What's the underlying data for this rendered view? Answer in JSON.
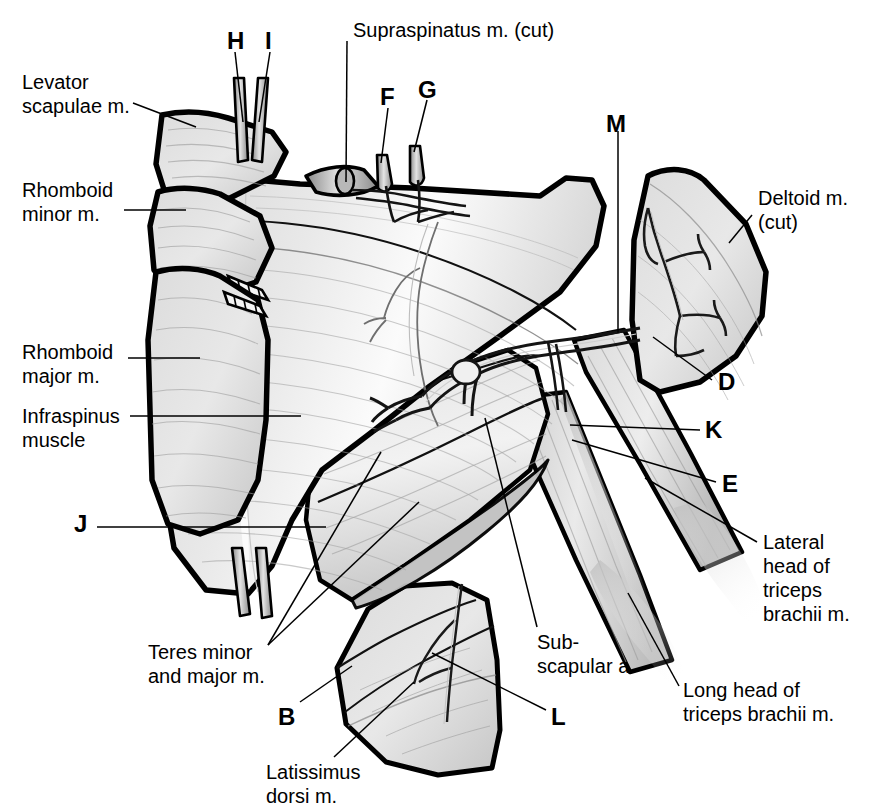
{
  "figure": {
    "style": {
      "ink": "#000000",
      "muscle_light": "#e6e6e6",
      "muscle_mid": "#d0d0d0",
      "muscle_dark": "#b0b0b0",
      "highlight": "#f7f7f7",
      "vessel": "#8f8f8f",
      "background": "#ffffff"
    }
  },
  "labels": [
    {
      "id": "levator-scapulae",
      "text": "Levator\nscapulae m.",
      "x": 22,
      "y": 70,
      "bold": false,
      "align": "left"
    },
    {
      "id": "rhomboid-minor",
      "text": "Rhomboid\nminor m.",
      "x": 22,
      "y": 178,
      "bold": false,
      "align": "left"
    },
    {
      "id": "rhomboid-major",
      "text": "Rhomboid\nmajor m.",
      "x": 22,
      "y": 340,
      "bold": false,
      "align": "left"
    },
    {
      "id": "infraspinus",
      "text": "Infraspinus\nmuscle",
      "x": 22,
      "y": 404,
      "bold": false,
      "align": "left"
    },
    {
      "id": "supraspinatus",
      "text": "Supraspinatus m. (cut)",
      "x": 353,
      "y": 18,
      "bold": false,
      "align": "left"
    },
    {
      "id": "deltoid",
      "text": "Deltoid m.\n(cut)",
      "x": 758,
      "y": 186,
      "bold": false,
      "align": "left"
    },
    {
      "id": "lateral-head",
      "text": "Lateral\nhead of\ntriceps\nbrachii m.",
      "x": 763,
      "y": 530,
      "bold": false,
      "align": "left"
    },
    {
      "id": "long-head",
      "text": "Long head of\ntriceps brachii m.",
      "x": 683,
      "y": 678,
      "bold": false,
      "align": "left"
    },
    {
      "id": "subscapular-a",
      "text": "Sub-\nscapular a.",
      "x": 537,
      "y": 630,
      "bold": false,
      "align": "left"
    },
    {
      "id": "teres-minor-major",
      "text": "Teres minor\nand major m.",
      "x": 148,
      "y": 640,
      "bold": false,
      "align": "left"
    },
    {
      "id": "latissimus-dorsi",
      "text": "Latissimus\ndorsi m.",
      "x": 266,
      "y": 760,
      "bold": false,
      "align": "left"
    },
    {
      "id": "marker-h",
      "text": "H",
      "x": 227,
      "y": 29,
      "bold": true,
      "align": "left"
    },
    {
      "id": "marker-i",
      "text": "I",
      "x": 265,
      "y": 29,
      "bold": true,
      "align": "left"
    },
    {
      "id": "marker-f",
      "text": "F",
      "x": 380,
      "y": 85,
      "bold": true,
      "align": "left"
    },
    {
      "id": "marker-g",
      "text": "G",
      "x": 418,
      "y": 78,
      "bold": true,
      "align": "left"
    },
    {
      "id": "marker-m",
      "text": "M",
      "x": 606,
      "y": 112,
      "bold": true,
      "align": "left"
    },
    {
      "id": "marker-d",
      "text": "D",
      "x": 718,
      "y": 370,
      "bold": true,
      "align": "left"
    },
    {
      "id": "marker-k",
      "text": "K",
      "x": 705,
      "y": 418,
      "bold": true,
      "align": "left"
    },
    {
      "id": "marker-e",
      "text": "E",
      "x": 722,
      "y": 472,
      "bold": true,
      "align": "left"
    },
    {
      "id": "marker-j",
      "text": "J",
      "x": 74,
      "y": 512,
      "bold": true,
      "align": "left"
    },
    {
      "id": "marker-b",
      "text": "B",
      "x": 278,
      "y": 705,
      "bold": true,
      "align": "left"
    },
    {
      "id": "marker-l",
      "text": "L",
      "x": 551,
      "y": 705,
      "bold": true,
      "align": "left"
    }
  ],
  "leader_lines": [
    {
      "id": "leader-levator-scapulae",
      "points": "133,103 196,127"
    },
    {
      "id": "leader-rhomboid-minor",
      "points": "124,210 186,210"
    },
    {
      "id": "leader-rhomboid-major",
      "points": "128,358 200,358"
    },
    {
      "id": "leader-infraspinus",
      "points": "130,416 301,416"
    },
    {
      "id": "leader-supraspinatus",
      "points": "347,41 346,182"
    },
    {
      "id": "leader-deltoid",
      "points": "752,215 729,243"
    },
    {
      "id": "leader-lateral-head",
      "points": "757,542 645,478"
    },
    {
      "id": "leader-long-head",
      "points": "679,686 628,593"
    },
    {
      "id": "leader-subscapular-a",
      "points": "537,627 485,418"
    },
    {
      "id": "leader-teres-1",
      "points": "268,645 381,452"
    },
    {
      "id": "leader-teres-2",
      "points": "268,645 419,502"
    },
    {
      "id": "leader-latissimus",
      "points": "334,757 414,682"
    },
    {
      "id": "leader-h",
      "points": "235,52 243,122"
    },
    {
      "id": "leader-i",
      "points": "270,52 259,122"
    },
    {
      "id": "leader-f",
      "points": "388,108 381,163"
    },
    {
      "id": "leader-g",
      "points": "427,100 414,152"
    },
    {
      "id": "leader-m",
      "points": "618,131 618,333"
    },
    {
      "id": "leader-d",
      "points": "712,380 653,337"
    },
    {
      "id": "leader-k",
      "points": "700,430 570,425"
    },
    {
      "id": "leader-e",
      "points": "716,482 572,440"
    },
    {
      "id": "leader-j",
      "points": "97,527 326,527"
    },
    {
      "id": "leader-b",
      "points": "300,702 352,666"
    },
    {
      "id": "leader-l",
      "points": "546,710 432,653"
    }
  ],
  "structures": [
    {
      "id": "levator-scapulae-flap",
      "kind": "muscle-flap"
    },
    {
      "id": "rhomboid-minor-flap",
      "kind": "muscle-flap"
    },
    {
      "id": "rhomboid-major-flap",
      "kind": "muscle-flap"
    },
    {
      "id": "infraspinatus-body",
      "kind": "muscle-belly"
    },
    {
      "id": "supraspinatus-stump",
      "kind": "cut-muscle-stump"
    },
    {
      "id": "deltoid-flap",
      "kind": "muscle-flap"
    },
    {
      "id": "teres-group",
      "kind": "muscle-belly"
    },
    {
      "id": "latissimus-dorsi-flap",
      "kind": "muscle-flap"
    },
    {
      "id": "triceps-long-head",
      "kind": "muscle-belly"
    },
    {
      "id": "triceps-lateral-head",
      "kind": "muscle-belly"
    },
    {
      "id": "subscapular-artery",
      "kind": "vessel"
    },
    {
      "id": "circumflex-scapular-vessels",
      "kind": "vessel"
    },
    {
      "id": "thoracodorsal-vessels",
      "kind": "vessel"
    },
    {
      "id": "axillary-nerve-branches",
      "kind": "vessel"
    },
    {
      "id": "nerve-stump-h",
      "kind": "cut-stump"
    },
    {
      "id": "nerve-stump-i",
      "kind": "cut-stump"
    },
    {
      "id": "vessel-stump-f",
      "kind": "cut-stump"
    },
    {
      "id": "vessel-stump-g",
      "kind": "cut-stump"
    }
  ]
}
